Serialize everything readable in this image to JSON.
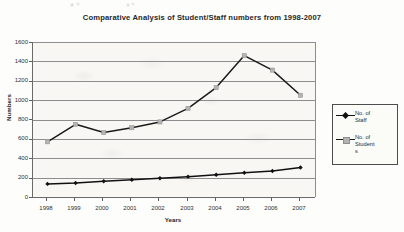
{
  "chart_data": {
    "type": "line",
    "title": "Comparative Analysis of Student/Staff numbers from 1998-2007",
    "xlabel": "Years",
    "ylabel": "Numbers",
    "categories": [
      "1998",
      "1999",
      "2000",
      "2001",
      "2002",
      "2003",
      "2004",
      "2005",
      "2006",
      "2007"
    ],
    "x": [
      1998,
      1999,
      2000,
      2001,
      2002,
      2003,
      2004,
      2005,
      2006,
      2007
    ],
    "series": [
      {
        "name": "No. of Staff",
        "legend_label": "No. of\nStaff",
        "marker": "diamond",
        "color": "#111111",
        "values": [
          135,
          145,
          163,
          178,
          193,
          210,
          230,
          250,
          268,
          305
        ]
      },
      {
        "name": "No. of Students",
        "legend_label": "No. of\nStudent\ns",
        "marker": "square",
        "color": "#1a1a1a",
        "marker_color": "#b3b3b3",
        "values": [
          570,
          750,
          665,
          715,
          775,
          915,
          1130,
          1460,
          1310,
          1050
        ]
      }
    ],
    "ylim": [
      0,
      1600
    ],
    "y_ticks": [
      "0",
      "200",
      "400",
      "600",
      "800",
      "1000",
      "1200",
      "1400",
      "1600"
    ],
    "y_tick_values": [
      0,
      200,
      400,
      600,
      800,
      1000,
      1200,
      1400,
      1600
    ],
    "grid": true,
    "grid_axis": "y",
    "legend_position": "right",
    "colors": {
      "plot_background": "#f8f7f3",
      "page_background": "#fdfdfb",
      "gridline": "#8d8d8d",
      "axis": "#6a6a6a",
      "text": "#25282c",
      "staff_marker": "#111111",
      "students_marker": "#b3b3b3"
    }
  }
}
